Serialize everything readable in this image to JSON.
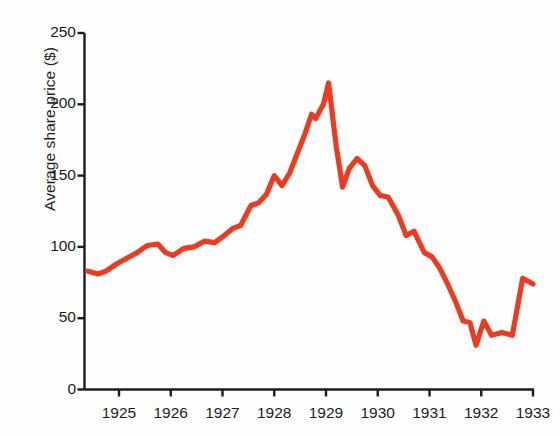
{
  "chart_data": {
    "type": "line",
    "title": "",
    "xlabel": "",
    "ylabel": "Average share price ($)",
    "xlim": [
      1924.4,
      1933.0
    ],
    "ylim": [
      0,
      250
    ],
    "grid": false,
    "legend": null,
    "line_color": "#ee3b20",
    "axis_color": "#1c1c1c",
    "x_ticks": [
      1925,
      1926,
      1927,
      1928,
      1929,
      1930,
      1931,
      1932,
      1933
    ],
    "x_tick_labels": [
      "1925",
      "1926",
      "1927",
      "1928",
      "1929",
      "1930",
      "1931",
      "1932",
      "1933"
    ],
    "y_ticks": [
      0,
      50,
      100,
      150,
      200,
      250
    ],
    "y_tick_labels": [
      "0",
      "50",
      "100",
      "150",
      "200",
      "250"
    ],
    "series": [
      {
        "name": "Average share price",
        "x": [
          1924.4,
          1924.6,
          1924.75,
          1924.95,
          1925.15,
          1925.35,
          1925.55,
          1925.75,
          1925.9,
          1926.05,
          1926.25,
          1926.45,
          1926.65,
          1926.85,
          1927.0,
          1927.2,
          1927.35,
          1927.55,
          1927.7,
          1927.85,
          1928.0,
          1928.15,
          1928.3,
          1928.45,
          1928.6,
          1928.72,
          1928.8,
          1928.95,
          1929.05,
          1929.2,
          1929.32,
          1929.45,
          1929.6,
          1929.75,
          1929.9,
          1930.05,
          1930.2,
          1930.4,
          1930.55,
          1930.7,
          1930.9,
          1931.05,
          1931.2,
          1931.35,
          1931.5,
          1931.65,
          1931.78,
          1931.9,
          1932.05,
          1932.2,
          1932.4,
          1932.6,
          1932.8,
          1933.0
        ],
        "y": [
          83,
          81,
          83,
          88,
          92,
          96,
          101,
          102,
          96,
          94,
          99,
          100,
          104,
          103,
          107,
          113,
          115,
          129,
          131,
          137,
          150,
          143,
          152,
          166,
          180,
          193,
          190,
          200,
          215,
          170,
          142,
          155,
          162,
          157,
          143,
          136,
          135,
          122,
          108,
          111,
          96,
          93,
          85,
          74,
          62,
          48,
          47,
          31,
          48,
          38,
          40,
          38,
          78,
          74
        ],
        "units": "$"
      }
    ]
  },
  "axis_title_y": "Average share price ($)"
}
